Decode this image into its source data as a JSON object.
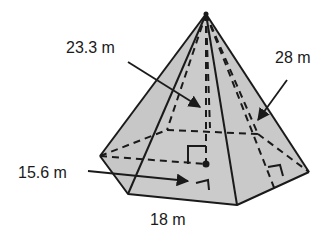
{
  "figure": {
    "shape": "hexagonal pyramid",
    "fill_color": "#c8c8c8",
    "stroke_color": "#1a1a1a",
    "labels": {
      "slant_height": "23.3 m",
      "lateral_edge": "28 m",
      "apothem": "15.6 m",
      "base_side": "18 m"
    }
  }
}
